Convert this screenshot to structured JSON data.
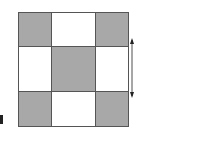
{
  "diagram": {
    "type": "3x3 checkerboard grid",
    "rows": 3,
    "cols": 3,
    "cells": [
      [
        "shaded",
        "blank",
        "shaded"
      ],
      [
        "blank",
        "shaded",
        "blank"
      ],
      [
        "shaded",
        "blank",
        "shaded"
      ]
    ],
    "colors": {
      "shaded": "#a8a8a8",
      "blank": "#ffffff",
      "border": "#555555"
    },
    "dimension_marker": {
      "description": "double-headed arrow indicating height of middle row",
      "label": ""
    }
  }
}
